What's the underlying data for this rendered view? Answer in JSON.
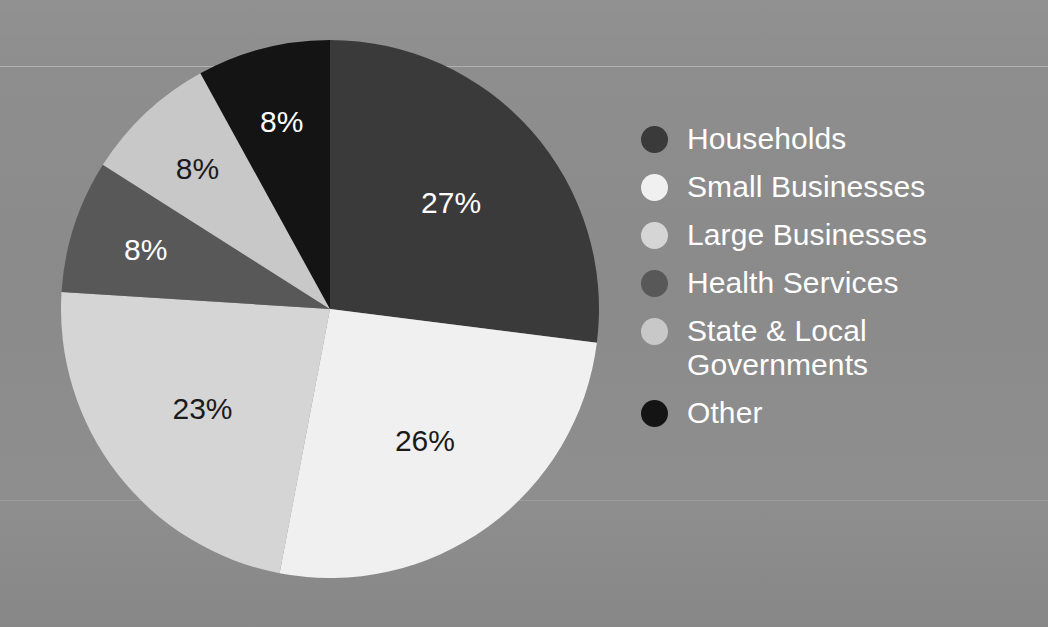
{
  "background": {
    "color": "#8c8c8c",
    "rule_color": "#ffffff"
  },
  "chart_data": {
    "type": "pie",
    "title": "",
    "subtitle": "",
    "xlabel": "",
    "ylabel": "",
    "grid": false,
    "legend_position": "right",
    "start_angle_deg": 0,
    "direction": "clockwise",
    "units": "percent",
    "categories": [
      "Households",
      "Small Businesses",
      "Large Businesses",
      "Health Services",
      "State & Local Governments",
      "Other"
    ],
    "values": [
      27,
      26,
      23,
      8,
      8,
      8
    ],
    "value_labels": [
      "27%",
      "26%",
      "23%",
      "8%",
      "8%",
      "8%"
    ],
    "colors": [
      "#3a3a3a",
      "#f0f0f0",
      "#d5d5d5",
      "#585858",
      "#c8c8c8",
      "#141414"
    ],
    "label_text_colors": [
      "#ffffff",
      "#1b1b1b",
      "#1b1b1b",
      "#ffffff",
      "#1b1b1b",
      "#ffffff"
    ],
    "total": 100
  },
  "legend": {
    "items": [
      {
        "label": "Households",
        "color": "#3a3a3a",
        "value_label": "27%"
      },
      {
        "label": "Small Businesses",
        "color": "#f0f0f0",
        "value_label": "26%"
      },
      {
        "label": "Large Businesses",
        "color": "#d5d5d5",
        "value_label": "23%"
      },
      {
        "label": "Health Services",
        "color": "#585858",
        "value_label": "8%"
      },
      {
        "label": "State & Local\nGovernments",
        "color": "#c8c8c8",
        "value_label": "8%"
      },
      {
        "label": "Other",
        "color": "#141414",
        "value_label": "8%"
      }
    ]
  }
}
